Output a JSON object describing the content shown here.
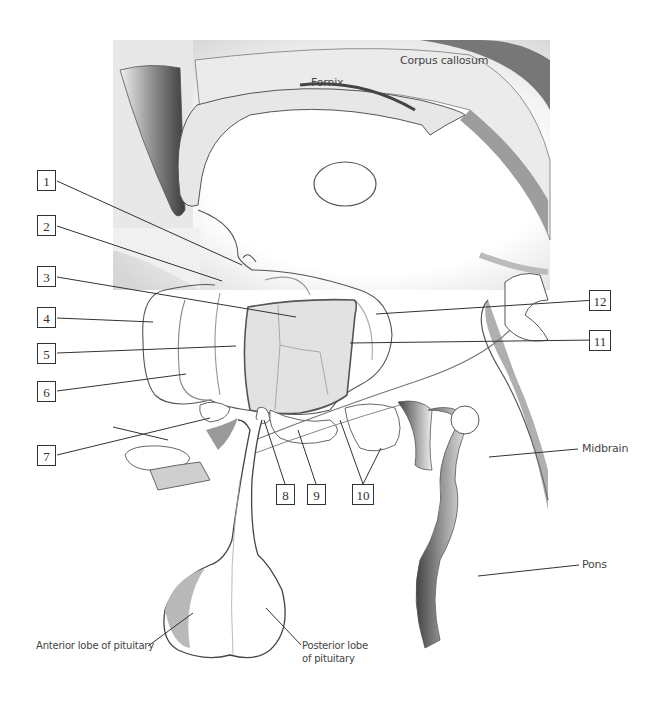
{
  "diagram": {
    "title_labels": {
      "corpus_callosum": "Corpus callosum",
      "fornix": "Fornix",
      "midbrain": "Midbrain",
      "pons": "Pons",
      "anterior_lobe": "Anterior lobe of pituitary",
      "posterior_lobe_line1": "Posterior lobe",
      "posterior_lobe_line2": "of pituitary"
    },
    "numbered_callouts": [
      {
        "n": "1"
      },
      {
        "n": "2"
      },
      {
        "n": "3"
      },
      {
        "n": "4"
      },
      {
        "n": "5"
      },
      {
        "n": "6"
      },
      {
        "n": "7"
      },
      {
        "n": "8"
      },
      {
        "n": "9"
      },
      {
        "n": "10"
      },
      {
        "n": "11"
      },
      {
        "n": "12"
      }
    ],
    "colors": {
      "outline": "#555555",
      "shade": "#9a9a9a",
      "panel": "#ececec",
      "nucleus_fill": "#e4e4e4"
    }
  }
}
